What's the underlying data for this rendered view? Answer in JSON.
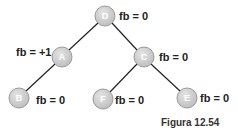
{
  "diagram": {
    "type": "avl-tree",
    "colors": {
      "node_fill": "#cfcfcf",
      "node_stroke": "#9a9a9a",
      "edge": "#222222",
      "text": "#222222"
    },
    "nodes": [
      {
        "id": "D",
        "label": "D",
        "fb": "fb = 0",
        "cx": 105,
        "cy": 16
      },
      {
        "id": "A",
        "label": "A",
        "fb": "fb = +1",
        "cx": 62,
        "cy": 57
      },
      {
        "id": "C",
        "label": "C",
        "fb": "fb = 0",
        "cx": 144,
        "cy": 57
      },
      {
        "id": "B",
        "label": "B",
        "fb": "fb = 0",
        "cx": 19,
        "cy": 98
      },
      {
        "id": "F",
        "label": "F",
        "fb": "fb = 0",
        "cx": 103,
        "cy": 99
      },
      {
        "id": "E",
        "label": "E",
        "fb": "fb = 0",
        "cx": 187,
        "cy": 98
      }
    ],
    "edges": [
      [
        "D",
        "A"
      ],
      [
        "D",
        "C"
      ],
      [
        "A",
        "B"
      ],
      [
        "C",
        "F"
      ],
      [
        "C",
        "E"
      ]
    ],
    "caption": "Figura 12.54"
  }
}
